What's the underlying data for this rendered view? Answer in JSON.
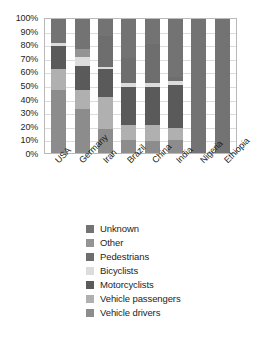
{
  "chart_data": {
    "type": "bar",
    "stacked": true,
    "stack_total": 100,
    "title": "",
    "subtitle": "",
    "xlabel": "",
    "ylabel": "",
    "ylim": [
      0,
      100
    ],
    "yticks": [
      "0%",
      "10%",
      "20%",
      "30%",
      "40%",
      "50%",
      "60%",
      "70%",
      "80%",
      "90%",
      "100%"
    ],
    "ytick_values": [
      0,
      10,
      20,
      30,
      40,
      50,
      60,
      70,
      80,
      90,
      100
    ],
    "grid": true,
    "grid_axis": "y",
    "legend_position": "bottom",
    "categories": [
      "USA",
      "Germany",
      "Iran",
      "Brazil",
      "China",
      "India",
      "Nigeria",
      "Ethiopia"
    ],
    "series": [
      {
        "name": "Vehicle drivers",
        "color": "#8c8c8c",
        "values": [
          47,
          33,
          18,
          10,
          9,
          10,
          0,
          0
        ]
      },
      {
        "name": "Vehicle passengers",
        "color": "#b0b0b0",
        "values": [
          16,
          14,
          24,
          11,
          12,
          9,
          0,
          0
        ]
      },
      {
        "name": "Motorcyclists",
        "color": "#5a5a5a",
        "values": [
          17,
          18,
          21,
          28,
          28,
          32,
          0,
          0
        ]
      },
      {
        "name": "Bicyclists",
        "color": "#dcdcdc",
        "values": [
          2,
          7,
          1,
          3,
          3,
          3,
          0,
          0
        ]
      },
      {
        "name": "Pedestrians",
        "color": "#6e6e6e",
        "values": [
          0,
          0,
          23,
          19,
          29,
          3,
          0,
          0
        ]
      },
      {
        "name": "Other",
        "color": "#949494",
        "values": [
          0,
          6,
          0,
          0,
          0,
          0,
          0,
          0
        ]
      },
      {
        "name": "Unknown",
        "color": "#737373",
        "values": [
          18,
          22,
          13,
          29,
          19,
          43,
          100,
          100
        ]
      }
    ]
  },
  "legend": {
    "items": [
      {
        "label": "Unknown",
        "color": "#737373"
      },
      {
        "label": "Other",
        "color": "#949494"
      },
      {
        "label": "Pedestrians",
        "color": "#6e6e6e"
      },
      {
        "label": "Bicyclists",
        "color": "#dcdcdc"
      },
      {
        "label": "Motorcyclists",
        "color": "#5a5a5a"
      },
      {
        "label": "Vehicle passengers",
        "color": "#b0b0b0"
      },
      {
        "label": "Vehicle drivers",
        "color": "#8c8c8c"
      }
    ]
  },
  "style": {
    "plot_border": "#b9b9b9",
    "gridline": "#dcdcdc",
    "background": "#ffffff",
    "text": "#231f20"
  }
}
